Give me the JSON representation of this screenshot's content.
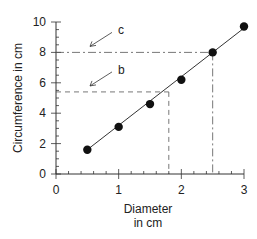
{
  "chart_data": {
    "type": "scatter",
    "title": "",
    "xlabel": "Diameter in cm",
    "xlabel_lines": [
      "Diameter",
      "in cm"
    ],
    "ylabel": "Circumference in cm",
    "xlim": [
      0,
      3
    ],
    "ylim": [
      0,
      10
    ],
    "x_ticks": [
      "0",
      "1",
      "2",
      "3"
    ],
    "y_ticks": [
      "0",
      "2",
      "4",
      "6",
      "8",
      "10"
    ],
    "grid": false,
    "series": [
      {
        "name": "measurements",
        "x": [
          0.5,
          1.0,
          1.5,
          2.0,
          2.5,
          3.0
        ],
        "y": [
          1.6,
          3.1,
          4.6,
          6.2,
          8.0,
          9.7
        ]
      }
    ],
    "fit_line": {
      "x": [
        0.5,
        3.0
      ],
      "y": [
        1.6,
        9.6
      ]
    },
    "annotations": [
      {
        "label": "b",
        "style": "dashed",
        "x": 1.8,
        "y": 5.4
      },
      {
        "label": "c",
        "style": "dash-dot",
        "x": 2.5,
        "y": 8.0
      }
    ]
  }
}
